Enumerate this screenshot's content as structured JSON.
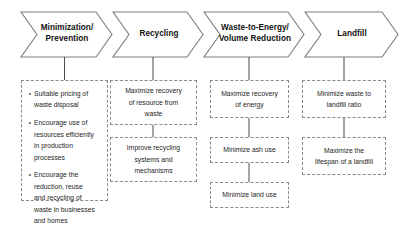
{
  "diagram": {
    "colors": {
      "arrow_stroke": "#7d7d7d",
      "arrow_fill": "#ffffff",
      "box_border": "#8a8a8a",
      "connector": "#4a4a4a",
      "text": "#1e1e1e",
      "header_text": "#111111"
    },
    "stages": [
      {
        "id": "stage-minimization-prevention",
        "header": "Minimization/\nPrevention",
        "type": "bullets",
        "items": [
          "Suitable pricing of\nwaste disposal",
          "Encourage use of\nresources efficiently\nin production\nprocesses",
          "Encourage the\nreduction, reuse\nand recycling of\nwaste in businesses\nand homes"
        ]
      },
      {
        "id": "stage-recycling",
        "header": "Recycling",
        "type": "boxes",
        "items": [
          "Maximize recovery\nof resource from\nwaste",
          "Improve recycling\nsystems and\nmechanisms"
        ]
      },
      {
        "id": "stage-waste-to-energy",
        "header": "Waste-to-Energy/\nVolume Reduction",
        "type": "boxes",
        "items": [
          "Maximize recovery\nof energy",
          "Minimize ash use",
          "Minimize land use"
        ]
      },
      {
        "id": "stage-landfill",
        "header": "Landfill",
        "type": "boxes",
        "items": [
          "Minimize waste to\nlandfill ratio",
          "Maximize the\nlifespan of a landfill"
        ]
      }
    ]
  }
}
